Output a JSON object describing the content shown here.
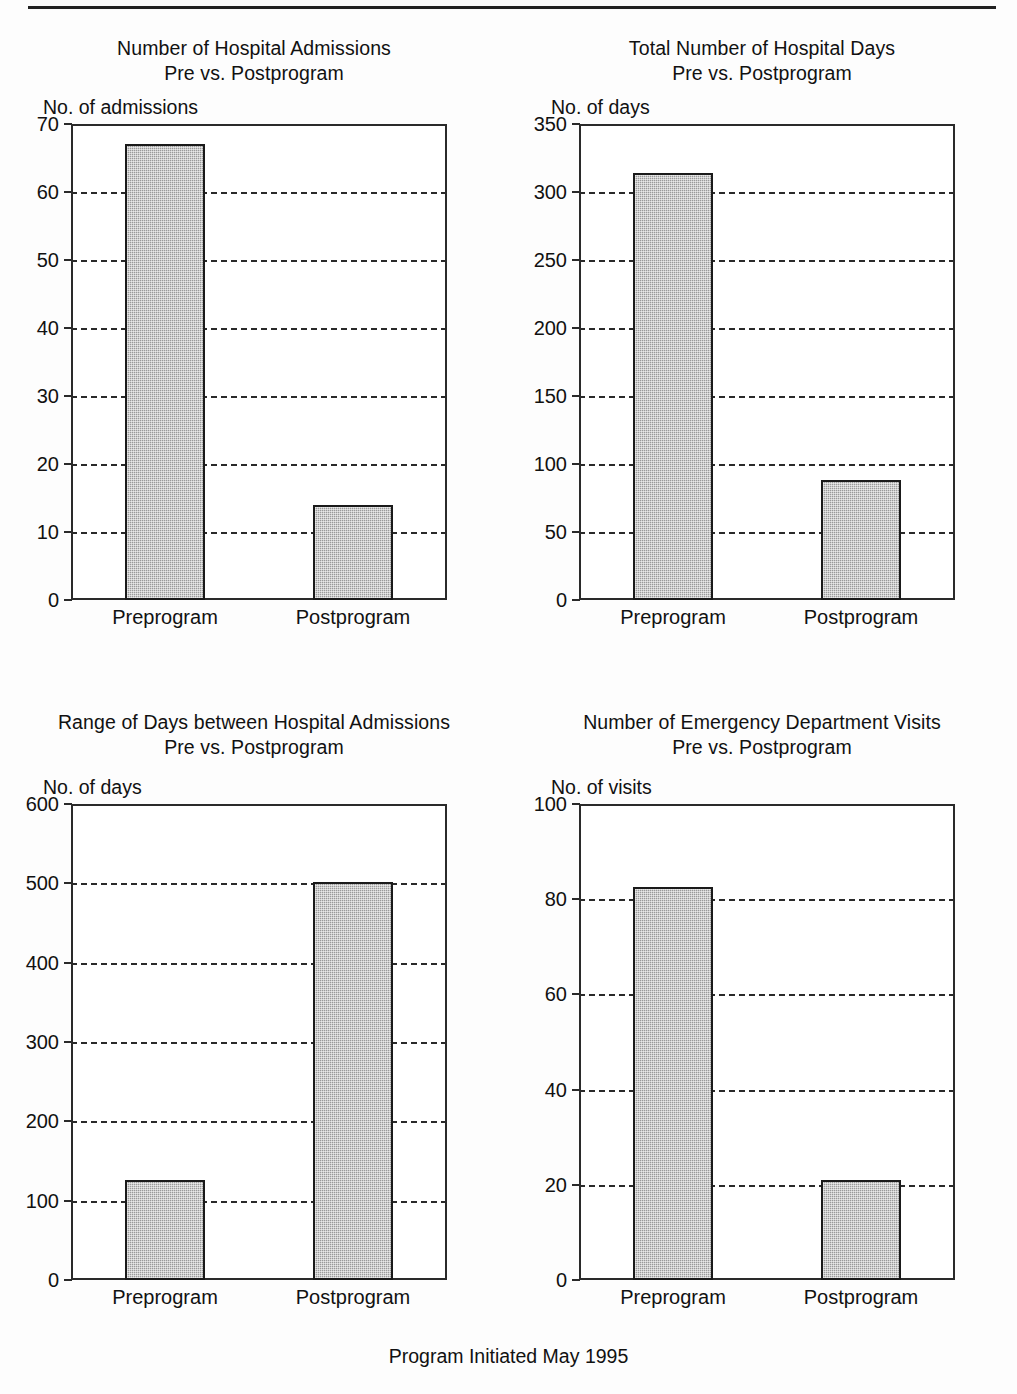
{
  "figure": {
    "caption": "Program Initiated May 1995",
    "bar_color": "#9a9a9a",
    "axis_color": "#2a2a2a",
    "categories": [
      "Preprogram",
      "Postprogram"
    ]
  },
  "chart_data": [
    {
      "type": "bar",
      "title": "Number of Hospital Admissions",
      "subtitle": "Pre vs. Postprogram",
      "ylabel": "No. of admissions",
      "xlabel": "",
      "categories": [
        "Preprogram",
        "Postprogram"
      ],
      "values": [
        67,
        14
      ],
      "ylim": [
        0,
        70
      ],
      "yticks": [
        0,
        10,
        20,
        30,
        40,
        50,
        60,
        70
      ],
      "ytick_labels": [
        "0",
        "10",
        "20",
        "30",
        "40",
        "50",
        "60",
        "70"
      ],
      "grid": true,
      "legend": "none"
    },
    {
      "type": "bar",
      "title": "Total Number of Hospital Days",
      "subtitle": "Pre vs. Postprogram",
      "ylabel": "No. of days",
      "xlabel": "",
      "categories": [
        "Preprogram",
        "Postprogram"
      ],
      "values": [
        314,
        88
      ],
      "ylim": [
        0,
        350
      ],
      "yticks": [
        0,
        50,
        100,
        150,
        200,
        250,
        300,
        350
      ],
      "ytick_labels": [
        "0",
        "50",
        "100",
        "150",
        "200",
        "250",
        "300",
        "350"
      ],
      "grid": true,
      "legend": "none"
    },
    {
      "type": "bar",
      "title": "Range of Days between Hospital Admissions",
      "subtitle": "Pre vs. Postprogram",
      "ylabel": "No. of days",
      "xlabel": "",
      "categories": [
        "Preprogram",
        "Postprogram"
      ],
      "values": [
        126,
        502
      ],
      "ylim": [
        0,
        600
      ],
      "yticks": [
        0,
        100,
        200,
        300,
        400,
        500,
        600
      ],
      "ytick_labels": [
        "0",
        "100",
        "200",
        "300",
        "400",
        "500",
        "600"
      ],
      "grid": true,
      "legend": "none"
    },
    {
      "type": "bar",
      "title": "Number of Emergency Department Visits",
      "subtitle": "Pre vs. Postprogram",
      "ylabel": "No. of visits",
      "xlabel": "",
      "categories": [
        "Preprogram",
        "Postprogram"
      ],
      "values": [
        82.5,
        21
      ],
      "ylim": [
        0,
        100
      ],
      "yticks": [
        0,
        20,
        40,
        60,
        80,
        100
      ],
      "ytick_labels": [
        "0",
        "20",
        "40",
        "60",
        "80",
        "100"
      ],
      "grid": true,
      "legend": "none"
    }
  ]
}
